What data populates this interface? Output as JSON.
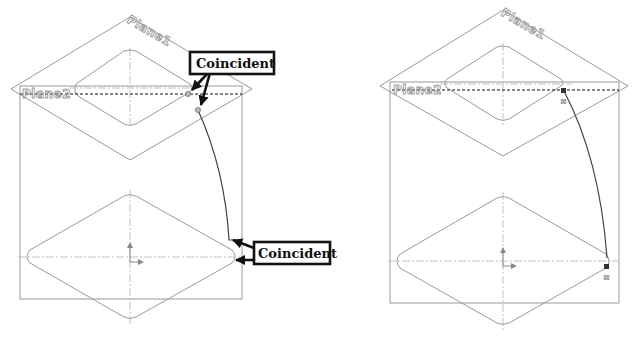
{
  "figure": {
    "panels": [
      {
        "id": "left",
        "plane1_label": "Plane1",
        "plane2_label": "Plane2",
        "callouts": [
          {
            "label": "Coincident",
            "target": "upper path endpoint"
          },
          {
            "label": "Coincident",
            "target": "lower path endpoint"
          }
        ]
      },
      {
        "id": "right",
        "plane1_label": "Plane1",
        "plane2_label": "Plane2",
        "callouts": []
      }
    ]
  }
}
